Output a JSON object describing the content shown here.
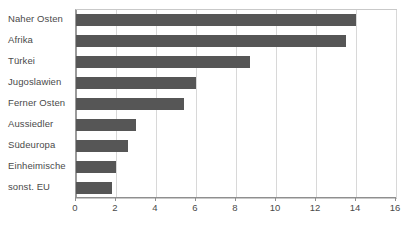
{
  "chart_data": {
    "type": "bar",
    "orientation": "horizontal",
    "title": "",
    "xlabel": "",
    "ylabel": "",
    "categories": [
      "Naher Osten",
      "Afrika",
      "Türkei",
      "Jugoslawien",
      "Ferner Osten",
      "Aussiedler",
      "Südeuropa",
      "Einheimische",
      "sonst. EU"
    ],
    "values": [
      14.0,
      13.5,
      8.7,
      6.0,
      5.4,
      3.0,
      2.6,
      2.0,
      1.8
    ],
    "xlim": [
      0,
      16
    ],
    "xticks": [
      0,
      2,
      4,
      6,
      8,
      10,
      12,
      14,
      16
    ],
    "xtick_labels": [
      "0",
      "2",
      "4",
      "6",
      "8",
      "10",
      "12",
      "14",
      "16"
    ],
    "grid": "vertical",
    "legend": "none",
    "bar_color": "#565656",
    "gridline_color": "#d8d8d8",
    "axis_color": "#8f8f8f",
    "plot_background": "#ffffff"
  }
}
